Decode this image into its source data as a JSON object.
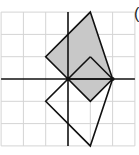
{
  "figure": {
    "label_fragment": "(",
    "grid": {
      "x_min": -3,
      "x_max": 3,
      "y_min": -3,
      "y_max": 3,
      "origin_px": [
        68,
        79
      ],
      "unit_px": 22.3,
      "grid_color": "#d4d4d4",
      "axis_color": "#111111"
    },
    "shaded_shape": {
      "fill": "#c8c8c8",
      "stroke": "#111111",
      "vertices": [
        [
          1,
          3
        ],
        [
          2,
          0
        ],
        [
          1,
          -1
        ],
        [
          0,
          0
        ],
        [
          -1,
          1
        ]
      ],
      "inner_lines": [
        [
          [
            0,
            0
          ],
          [
            1,
            1
          ]
        ],
        [
          [
            1,
            1
          ],
          [
            2,
            0
          ]
        ]
      ]
    },
    "outline_shape": {
      "fill": "none",
      "stroke": "#111111",
      "vertices": [
        [
          0,
          0
        ],
        [
          -1,
          -1
        ],
        [
          1,
          -3
        ],
        [
          2,
          0
        ]
      ]
    }
  }
}
